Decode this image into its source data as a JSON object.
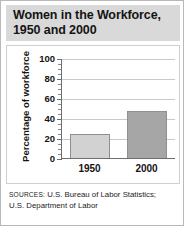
{
  "figure": {
    "title_line1": "Women in the Workforce,",
    "title_line2": "1950 and 2000",
    "source_prefix": "SOURCES:",
    "source_text": " U.S. Bureau of Labor Statistics;",
    "source_text_line2": "U.S. Department of Labor"
  },
  "colors": {
    "title_band": "#d9d9d9",
    "bar_1950": "#d2d2d2",
    "bar_2000": "#a6a6a6",
    "bar_border": "#8f8f8f",
    "gridline": "#c9c9c9",
    "axis": "#6e6e6e",
    "text": "#141414",
    "frame_border": "#cfcfcf",
    "outer_border": "#b9b9b9"
  },
  "chart_data": {
    "type": "bar",
    "title": "Women in the Workforce, 1950 and 2000",
    "xlabel": "",
    "ylabel": "Percentage of workforce",
    "categories": [
      "1950",
      "2000"
    ],
    "values": [
      24,
      47
    ],
    "ylim": [
      0,
      100
    ],
    "yticks": [
      0,
      20,
      40,
      60,
      80,
      100
    ],
    "ytick_labels": [
      "0",
      "20",
      "40",
      "60",
      "80",
      "100"
    ],
    "minor_tick_interval": 5,
    "grid": "horizontal",
    "legend": "none",
    "bar_colors": [
      "#d2d2d2",
      "#a6a6a6"
    ]
  }
}
